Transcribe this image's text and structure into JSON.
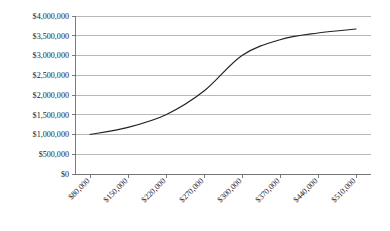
{
  "chart_data": {
    "type": "line",
    "title": "",
    "subtitle": "",
    "xlabel": "",
    "ylabel": "",
    "grid": true,
    "legend": false,
    "legend_position": "none",
    "series_color": "#222222",
    "gridline_color": "#a6a6a6",
    "axis_color": "#6e6e6e",
    "background_color": "#ffffff",
    "x_tick_rotation_deg": -45,
    "categories": [
      "$80,000",
      "$150,000",
      "$220,000",
      "$270,000",
      "$300,000",
      "$370,000",
      "$440,000",
      "$510,000"
    ],
    "x_values": [
      80000,
      150000,
      220000,
      270000,
      300000,
      370000,
      440000,
      510000
    ],
    "values": [
      1000000,
      1180000,
      1500000,
      2100000,
      3000000,
      3400000,
      3570000,
      3670000
    ],
    "series": [
      {
        "name": "Value",
        "values": [
          1000000,
          1180000,
          1500000,
          2100000,
          3000000,
          3400000,
          3570000,
          3670000
        ]
      }
    ],
    "ylim": [
      0,
      4000000
    ],
    "ytick_values": [
      0,
      500000,
      1000000,
      1500000,
      2000000,
      2500000,
      3000000,
      3500000,
      4000000
    ],
    "ytick_labels": [
      "$0",
      "$500,000",
      "$1,000,000",
      "$1,500,000",
      "$2,000,000",
      "$2,500,000",
      "$3,000,000",
      "$3,500,000",
      "$4,000,000"
    ]
  }
}
